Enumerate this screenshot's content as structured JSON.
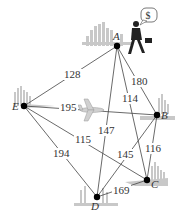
{
  "diagram": {
    "type": "weighted-complete-graph",
    "colors": {
      "edge": "#444444",
      "vertex": "#000000",
      "skyline": "#bdbdbd",
      "label": "#333333"
    },
    "vertices": [
      {
        "id": "A",
        "label": "A",
        "x": 117,
        "y": 46,
        "lx": 113,
        "ly": 40
      },
      {
        "id": "B",
        "label": "B",
        "x": 157,
        "y": 115,
        "lx": 161,
        "ly": 119
      },
      {
        "id": "C",
        "label": "C",
        "x": 147,
        "y": 180,
        "lx": 151,
        "ly": 188
      },
      {
        "id": "D",
        "label": "D",
        "x": 97,
        "y": 197,
        "lx": 91,
        "ly": 210
      },
      {
        "id": "E",
        "label": "E",
        "x": 24,
        "y": 106,
        "lx": 12,
        "ly": 110
      }
    ],
    "edges": [
      {
        "from": "A",
        "to": "E",
        "weight": "128",
        "lx": 64,
        "ly": 78
      },
      {
        "from": "A",
        "to": "B",
        "weight": "180",
        "lx": 131,
        "ly": 85
      },
      {
        "from": "A",
        "to": "C",
        "weight": "114",
        "lx": 122,
        "ly": 102
      },
      {
        "from": "A",
        "to": "D",
        "weight": "147",
        "lx": 98,
        "ly": 134
      },
      {
        "from": "E",
        "to": "B",
        "weight": "195",
        "lx": 60,
        "ly": 111
      },
      {
        "from": "E",
        "to": "C",
        "weight": "115",
        "lx": 75,
        "ly": 143
      },
      {
        "from": "E",
        "to": "D",
        "weight": "194",
        "lx": 53,
        "ly": 157
      },
      {
        "from": "B",
        "to": "D",
        "weight": "145",
        "lx": 117,
        "ly": 158
      },
      {
        "from": "B",
        "to": "C",
        "weight": "116",
        "lx": 145,
        "ly": 152
      },
      {
        "from": "D",
        "to": "C",
        "weight": "169",
        "lx": 113,
        "ly": 194
      }
    ],
    "decorations": {
      "speech_bubble_text": "$",
      "icons": [
        "businessman-icon",
        "airplane-icon",
        "city-skyline-icon"
      ]
    }
  }
}
